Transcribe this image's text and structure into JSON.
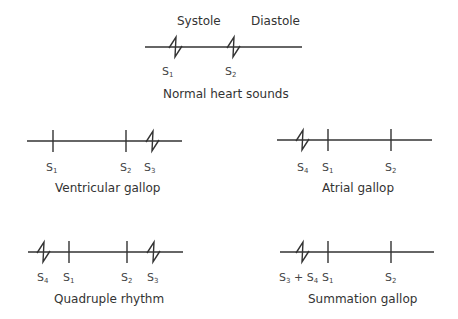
{
  "panels": [
    {
      "id": "normal",
      "title": "Normal heart sounds",
      "phase_labels": [
        "Systole",
        "Diastole"
      ],
      "sounds": [
        {
          "name": "S",
          "sub": "1",
          "mark": "zigzag"
        },
        {
          "name": "S",
          "sub": "2",
          "mark": "zigzag"
        }
      ]
    },
    {
      "id": "ventricular",
      "title": "Ventricular gallop",
      "sounds": [
        {
          "name": "S",
          "sub": "1",
          "mark": "tick"
        },
        {
          "name": "S",
          "sub": "2",
          "mark": "tick"
        },
        {
          "name": "S",
          "sub": "3",
          "mark": "zigzag"
        }
      ]
    },
    {
      "id": "atrial",
      "title": "Atrial gallop",
      "sounds": [
        {
          "name": "S",
          "sub": "4",
          "mark": "zigzag"
        },
        {
          "name": "S",
          "sub": "1",
          "mark": "tick"
        },
        {
          "name": "S",
          "sub": "2",
          "mark": "tick"
        }
      ]
    },
    {
      "id": "quadruple",
      "title": "Quadruple rhythm",
      "sounds": [
        {
          "name": "S",
          "sub": "4",
          "mark": "zigzag"
        },
        {
          "name": "S",
          "sub": "1",
          "mark": "tick"
        },
        {
          "name": "S",
          "sub": "2",
          "mark": "tick"
        },
        {
          "name": "S",
          "sub": "3",
          "mark": "zigzag"
        }
      ]
    },
    {
      "id": "summation",
      "title": "Summation gallop",
      "sounds": [
        {
          "name": "S",
          "sub": "3",
          "plus": "+",
          "name2": "S",
          "sub2": "4",
          "mark": "zigzag"
        },
        {
          "name": "S",
          "sub": "1",
          "mark": "tick"
        },
        {
          "name": "S",
          "sub": "2",
          "mark": "tick"
        }
      ]
    }
  ]
}
